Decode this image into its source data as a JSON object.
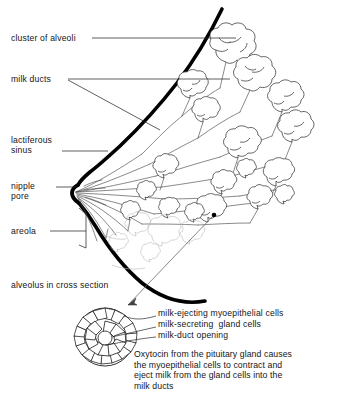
{
  "figure": {
    "ink_color": "#000000",
    "background_color": "#ffffff",
    "line_color": "#444444"
  },
  "labels": {
    "cluster_of_alveoli": "cluster of alveoli",
    "milk_ducts": "milk ducts",
    "lactiferous_sinus": "lactiferous\nsinus",
    "nipple_pore": "nipple\npore",
    "areola": "areola",
    "alveolus_in_cross_section": "alveolus in cross section"
  },
  "cell_labels": {
    "myoepithelial": "milk-ejecting myoepithelial cells",
    "gland_cells": "milk-secreting  gland cells",
    "duct_opening": "milk-duct opening"
  },
  "caption": {
    "text": "Oxytocin from the pituitary gland causes\nthe myoepithelial cells to contract and\neject milk from the gland cells into the\nmilk ducts"
  }
}
